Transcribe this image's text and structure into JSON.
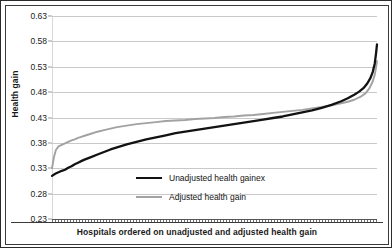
{
  "chart_data": {
    "type": "line",
    "title": "",
    "xlabel": "Hospitals ordered on unadjusted and adjusted health gain",
    "ylabel": "Health gain",
    "ylim": [
      0.23,
      0.63
    ],
    "yticks": [
      "0.63",
      "0.58",
      "0.53",
      "0.48",
      "0.43",
      "0.38",
      "0.33",
      "0.28",
      "0.23"
    ],
    "ytick_values": [
      0.63,
      0.58,
      0.53,
      0.48,
      0.43,
      0.38,
      0.33,
      0.28,
      0.23
    ],
    "grid": true,
    "xticks": [],
    "xlim": [
      0,
      100
    ],
    "legend_position": "inside-bottom-center",
    "series": [
      {
        "name": "Unadjusted health gainex",
        "color": "#121212",
        "x": [
          0,
          1,
          2,
          3,
          4,
          5,
          6,
          7,
          8,
          9,
          10,
          12,
          14,
          16,
          18,
          20,
          23,
          26,
          29,
          32,
          35,
          38,
          41,
          44,
          47,
          50,
          53,
          56,
          59,
          62,
          65,
          68,
          71,
          74,
          77,
          80,
          83,
          86,
          89,
          91,
          93,
          94.5,
          96,
          97,
          98,
          98.7,
          99.3,
          99.7,
          100
        ],
        "values": [
          0.315,
          0.319,
          0.322,
          0.325,
          0.327,
          0.331,
          0.334,
          0.338,
          0.341,
          0.344,
          0.347,
          0.352,
          0.357,
          0.362,
          0.367,
          0.371,
          0.377,
          0.382,
          0.387,
          0.391,
          0.395,
          0.399,
          0.402,
          0.405,
          0.408,
          0.411,
          0.414,
          0.417,
          0.42,
          0.423,
          0.426,
          0.429,
          0.432,
          0.436,
          0.44,
          0.444,
          0.449,
          0.455,
          0.462,
          0.468,
          0.475,
          0.481,
          0.489,
          0.497,
          0.508,
          0.52,
          0.536,
          0.556,
          0.574
        ]
      },
      {
        "name": "Adjusted health gain",
        "color": "#a2a2a2",
        "x": [
          0,
          0.6,
          1.2,
          2,
          3,
          4,
          5,
          6,
          7,
          8,
          9,
          10,
          12,
          14,
          16,
          18,
          20,
          23,
          26,
          29,
          32,
          35,
          38,
          41,
          44,
          47,
          50,
          53,
          56,
          59,
          62,
          65,
          68,
          71,
          74,
          77,
          80,
          83,
          86,
          89,
          91,
          93,
          95,
          96.5,
          97.7,
          98.6,
          99.3,
          99.7,
          100
        ],
        "values": [
          0.33,
          0.352,
          0.366,
          0.373,
          0.376,
          0.379,
          0.382,
          0.385,
          0.387,
          0.39,
          0.392,
          0.394,
          0.398,
          0.402,
          0.405,
          0.408,
          0.411,
          0.414,
          0.417,
          0.419,
          0.421,
          0.423,
          0.424,
          0.425,
          0.427,
          0.428,
          0.429,
          0.431,
          0.432,
          0.434,
          0.435,
          0.437,
          0.439,
          0.441,
          0.443,
          0.445,
          0.448,
          0.451,
          0.454,
          0.458,
          0.461,
          0.465,
          0.471,
          0.478,
          0.488,
          0.5,
          0.514,
          0.528,
          0.541
        ]
      }
    ]
  },
  "legend": {
    "items": [
      {
        "label": "Unadjusted health gainex"
      },
      {
        "label": "Adjusted health gain"
      }
    ]
  }
}
